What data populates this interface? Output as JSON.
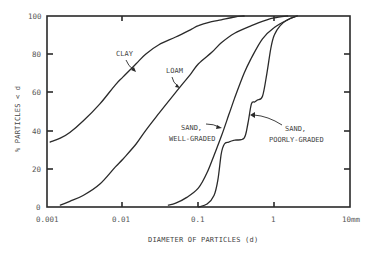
{
  "chart_data": {
    "type": "line",
    "title": "",
    "xlabel": "DIAMETER OF PARTICLES (d)",
    "ylabel": "% PARTICLES < d",
    "xscale": "log",
    "xlim": [
      0.001,
      10
    ],
    "ylim": [
      0,
      100
    ],
    "grid": false,
    "legend": "none (curves labeled directly)",
    "x_tick_labels": [
      "0.001",
      "0.01",
      "0.1",
      "1",
      "10mm"
    ],
    "x_ticks": [
      0.001,
      0.01,
      0.1,
      1,
      10
    ],
    "y_tick_labels": [
      "0",
      "20",
      "40",
      "60",
      "80",
      "100"
    ],
    "y_ticks": [
      0,
      20,
      40,
      60,
      80,
      100
    ],
    "series": [
      {
        "name": "CLAY",
        "x": [
          0.0011,
          0.0015,
          0.002,
          0.003,
          0.005,
          0.008,
          0.01,
          0.015,
          0.02,
          0.03,
          0.05,
          0.08,
          0.1,
          0.15,
          0.2,
          0.3,
          0.4
        ],
        "values": [
          34,
          36,
          39,
          45,
          54,
          64,
          68,
          75,
          80,
          85,
          89,
          93,
          95,
          97,
          98,
          99.5,
          100
        ]
      },
      {
        "name": "LOAM",
        "x": [
          0.0015,
          0.002,
          0.003,
          0.005,
          0.008,
          0.01,
          0.015,
          0.02,
          0.03,
          0.05,
          0.08,
          0.1,
          0.15,
          0.2,
          0.3,
          0.5,
          0.8,
          1.0,
          1.5
        ],
        "values": [
          1,
          3,
          6,
          12,
          21,
          25,
          33,
          40,
          49,
          60,
          70,
          75,
          81,
          86,
          91,
          95,
          98,
          99,
          100
        ]
      },
      {
        "name": "SAND, WELL-GRADED",
        "x": [
          0.04,
          0.05,
          0.07,
          0.1,
          0.13,
          0.16,
          0.2,
          0.25,
          0.3,
          0.4,
          0.5,
          0.7,
          1.0,
          1.5,
          2.0
        ],
        "values": [
          1,
          2,
          5,
          10,
          18,
          27,
          37,
          48,
          57,
          70,
          78,
          88,
          94,
          98,
          100
        ]
      },
      {
        "name": "SAND, POORLY-GRADED",
        "x": [
          0.1,
          0.13,
          0.16,
          0.18,
          0.2,
          0.22,
          0.25,
          0.3,
          0.4,
          0.45,
          0.5,
          0.55,
          0.6,
          0.7,
          0.8,
          0.9,
          1.0,
          1.2,
          1.5,
          2.0
        ],
        "values": [
          0,
          1.5,
          6,
          14,
          28,
          33,
          34,
          35,
          36,
          44,
          54,
          55,
          56,
          58,
          70,
          83,
          90,
          95,
          98,
          100
        ]
      }
    ],
    "annotations": [
      {
        "text": "CLAY",
        "points_to": "CLAY curve"
      },
      {
        "text": "LOAM",
        "points_to": "LOAM curve"
      },
      {
        "text": "SAND, WELL-GRADED",
        "points_to": "SAND, WELL-GRADED curve"
      },
      {
        "text": "SAND, POORLY-GRADED",
        "points_to": "SAND, POORLY-GRADED curve"
      }
    ]
  },
  "labels": {
    "xlabel": "DIAMETER OF PARTICLES (d)",
    "ylabel": "% PARTICLES < d",
    "clay": "CLAY",
    "loam": "LOAM",
    "sand_wg_line1": "SAND,",
    "sand_wg_line2": "WELL-GRADED",
    "sand_pg_line1": "SAND,",
    "sand_pg_line2": "POORLY-GRADED",
    "x0": "0.001",
    "x1": "0.01",
    "x2": "0.1",
    "x3": "1",
    "x4": "10mm",
    "y0": "0",
    "y1": "20",
    "y2": "40",
    "y3": "60",
    "y4": "80",
    "y5": "100"
  },
  "colors": {
    "line": "#2a2a2a",
    "text": "#444444",
    "background": "#ffffff"
  }
}
